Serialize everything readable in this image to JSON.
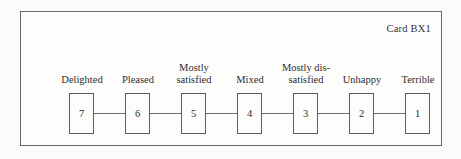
{
  "card": {
    "id_label": "Card BX1",
    "frame_color": "#67676b",
    "box_border_color": "#5d5d62",
    "connector_color": "#6a6a6f",
    "paper_color": "#fbfbfa",
    "text_color": "#2b2b2b"
  },
  "scale": {
    "points": [
      {
        "value": "7",
        "label_lines": [
          "Delighted"
        ]
      },
      {
        "value": "6",
        "label_lines": [
          "Pleased"
        ]
      },
      {
        "value": "5",
        "label_lines": [
          "Mostly",
          "satisfied"
        ]
      },
      {
        "value": "4",
        "label_lines": [
          "Mixed"
        ]
      },
      {
        "value": "3",
        "label_lines": [
          "Mostly dis-",
          "satisfied"
        ]
      },
      {
        "value": "2",
        "label_lines": [
          "Unhappy"
        ]
      },
      {
        "value": "1",
        "label_lines": [
          "Terrible"
        ]
      }
    ]
  },
  "chart_data": {
    "type": "table",
    "title": "Card BX1",
    "xlabel": "",
    "ylabel": "",
    "categories": [
      "Delighted",
      "Pleased",
      "Mostly satisfied",
      "Mixed",
      "Mostly dissatisfied",
      "Unhappy",
      "Terrible"
    ],
    "values": [
      7,
      6,
      5,
      4,
      3,
      2,
      1
    ],
    "annotations": [
      "Card BX1"
    ],
    "grid": false,
    "legend": "none"
  }
}
